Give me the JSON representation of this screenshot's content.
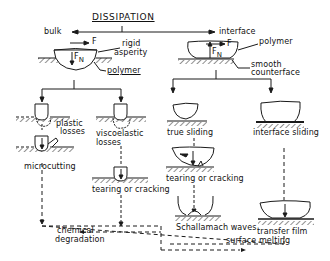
{
  "diagram": {
    "title": "DISSIPATION",
    "branches": {
      "bulk": {
        "label": "bulk",
        "contact_labels": {
          "force": "F",
          "normal_force": "F",
          "normal_force_sub": "N",
          "asperity": "rigid\nasperity",
          "asperity_line1": "rigid",
          "asperity_line2": "asperity",
          "substrate": "polymer"
        },
        "mechanisms": [
          {
            "label_line1": "plastic",
            "label_line2": "losses",
            "result": "microcutting"
          },
          {
            "label_line1": "viscoelastic",
            "label_line2": "losses",
            "result": "tearing or cracking"
          }
        ]
      },
      "interface": {
        "label": "interface",
        "contact_labels": {
          "force": "F",
          "normal_force": "F",
          "normal_force_sub": "N",
          "slider": "polymer",
          "counterface_line1": "smooth",
          "counterface_line2": "counterface"
        },
        "mechanisms": [
          {
            "label": "true sliding",
            "result": "tearing or cracking",
            "result2": "Schallamach waves"
          },
          {
            "label": "interface sliding",
            "result": "transfer film"
          }
        ]
      }
    },
    "outcomes": {
      "left": {
        "line1": "chemical",
        "line2": "degradation"
      },
      "right": "surface melting"
    }
  }
}
